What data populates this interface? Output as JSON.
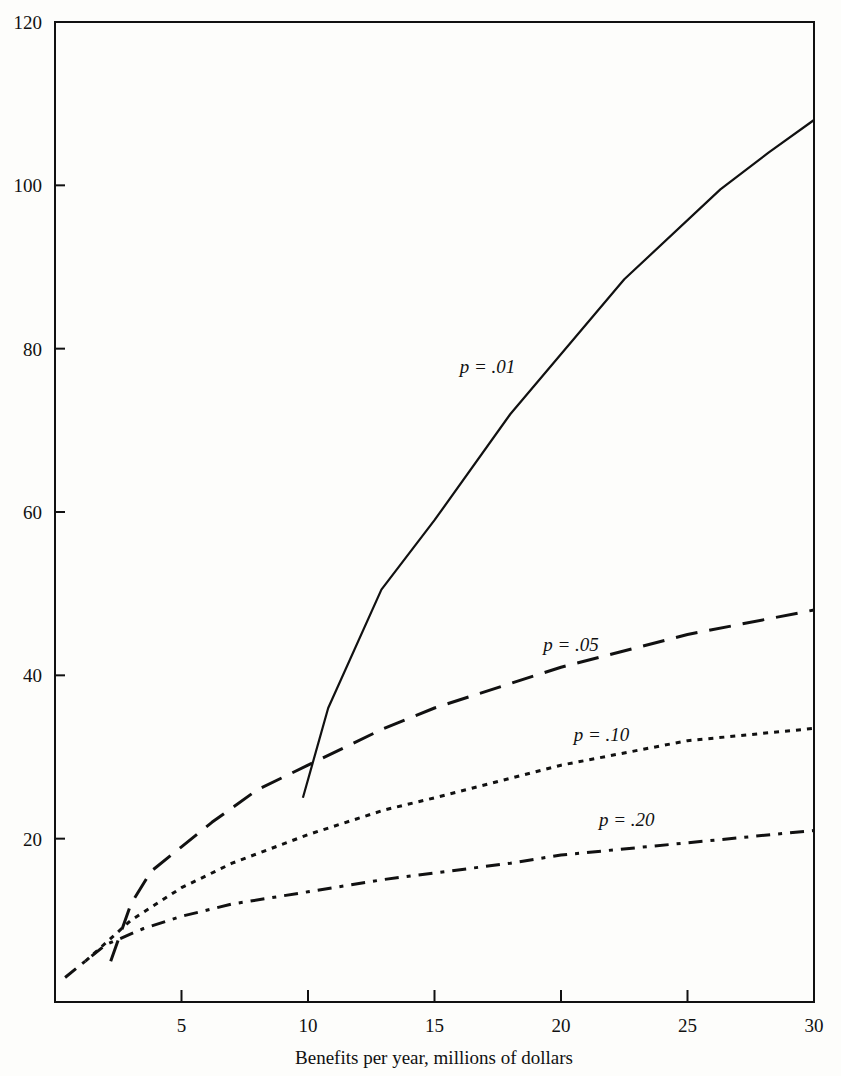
{
  "chart_data": {
    "type": "line",
    "title": "",
    "xlabel": "Benefits per year, millions of dollars",
    "ylabel": "",
    "xlim": [
      0,
      30
    ],
    "ylim": [
      0,
      120
    ],
    "grid": false,
    "legend_position": "inline labels on curves",
    "x_ticks": [
      "5",
      "10",
      "15",
      "20",
      "25",
      "30"
    ],
    "y_ticks": [
      "20",
      "40",
      "60",
      "80",
      "100",
      "120"
    ],
    "series": [
      {
        "name": "p = .01",
        "style": "solid",
        "points": [
          [
            9.8,
            25
          ],
          [
            10.8,
            36
          ],
          [
            12.9,
            50.5
          ],
          [
            15,
            59
          ],
          [
            18,
            72
          ],
          [
            22.5,
            88.5
          ],
          [
            26.3,
            99.5
          ],
          [
            28.2,
            104
          ],
          [
            30,
            108
          ]
        ]
      },
      {
        "name": "p = .05",
        "style": "long-dash",
        "points": [
          [
            2.2,
            5
          ],
          [
            3,
            12
          ],
          [
            3.8,
            16
          ],
          [
            5,
            19
          ],
          [
            6.2,
            22
          ],
          [
            8,
            26
          ],
          [
            10,
            29
          ],
          [
            13,
            33.5
          ],
          [
            15,
            36
          ],
          [
            20,
            41
          ],
          [
            25,
            45
          ],
          [
            30,
            48
          ]
        ]
      },
      {
        "name": "p = .10",
        "style": "dotted",
        "points": [
          [
            1.2,
            5
          ],
          [
            3,
            10
          ],
          [
            5,
            14
          ],
          [
            7,
            17
          ],
          [
            10,
            20.5
          ],
          [
            13,
            23.5
          ],
          [
            15,
            25
          ],
          [
            20,
            29
          ],
          [
            25,
            32
          ],
          [
            30,
            33.5
          ]
        ]
      },
      {
        "name": "p = .20",
        "style": "dash-dot",
        "points": [
          [
            0.4,
            3
          ],
          [
            2,
            7
          ],
          [
            3.5,
            9
          ],
          [
            5,
            10.5
          ],
          [
            7,
            12
          ],
          [
            10,
            13.5
          ],
          [
            13,
            15
          ],
          [
            18,
            17
          ],
          [
            20,
            18
          ],
          [
            25,
            19.5
          ],
          [
            30,
            21
          ]
        ]
      }
    ],
    "annotations": [
      {
        "text": "p = .01",
        "x": 16,
        "y": 77
      },
      {
        "text": "p = .05",
        "x": 19.3,
        "y": 43
      },
      {
        "text": "p = .10",
        "x": 20.5,
        "y": 32
      },
      {
        "text": "p = .20",
        "x": 21.5,
        "y": 21.5
      }
    ]
  },
  "axes": {
    "x_title": "Benefits per year, millions of dollars",
    "x_ticks": [
      "5",
      "10",
      "15",
      "20",
      "25",
      "30"
    ],
    "y_ticks": [
      "20",
      "40",
      "60",
      "80",
      "100",
      "120"
    ]
  },
  "labels": {
    "p01": "p = .01",
    "p05": "p = .05",
    "p10": "p = .10",
    "p20": "p = .20"
  }
}
